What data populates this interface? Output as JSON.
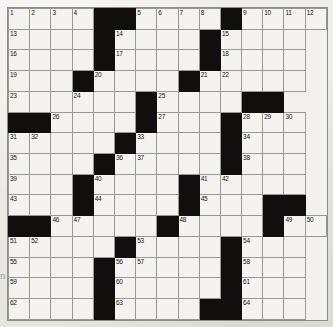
{
  "puzzle": {
    "type": "crossword-grid",
    "columns": 13,
    "rows": 15,
    "colors": {
      "block": "#100f0d",
      "cell": "#f4f3ef",
      "grid_line": "#9a9995",
      "page_background": "#ebeae6",
      "number_text": "#171614"
    },
    "margin_mark": "n",
    "grid": [
      [
        {
          "num": "1"
        },
        {
          "num": "2"
        },
        {
          "num": "3"
        },
        {
          "num": "4"
        },
        {
          "block": true
        },
        {
          "block": true
        },
        {
          "num": "5"
        },
        {
          "num": "6"
        },
        {
          "num": "7"
        },
        {
          "num": "8"
        },
        {
          "block": true
        },
        {
          "num": "9"
        },
        {
          "num": "10"
        },
        {
          "num": "11"
        },
        {
          "num": "12"
        }
      ],
      [
        {
          "num": "13"
        },
        {},
        {},
        {},
        {
          "block": true
        },
        {
          "num": "14"
        },
        {},
        {},
        {},
        {
          "block": true
        },
        {
          "num": "15"
        },
        {},
        {},
        {}
      ],
      [
        {
          "num": "16"
        },
        {},
        {},
        {},
        {
          "block": true
        },
        {
          "num": "17"
        },
        {},
        {},
        {},
        {
          "block": true
        },
        {
          "num": "18"
        },
        {},
        {},
        {}
      ],
      [
        {
          "num": "19"
        },
        {},
        {},
        {
          "block": true
        },
        {
          "num": "20"
        },
        {},
        {},
        {},
        {
          "block": true
        },
        {
          "num": "21"
        },
        {
          "num": "22"
        },
        {},
        {},
        {}
      ],
      [
        {
          "num": "23"
        },
        {},
        {},
        {
          "num": "24"
        },
        {},
        {},
        {
          "block": true
        },
        {
          "num": "25"
        },
        {},
        {},
        {},
        {
          "block": true
        },
        {
          "block": true
        }
      ],
      [
        {
          "block": true
        },
        {
          "block": true
        },
        {
          "num": "26"
        },
        {},
        {},
        {},
        {
          "block": true
        },
        {
          "num": "27"
        },
        {},
        {},
        {
          "block": true
        },
        {
          "num": "28"
        },
        {
          "num": "29"
        },
        {
          "num": "30"
        }
      ],
      [
        {
          "num": "31"
        },
        {
          "num": "32"
        },
        {},
        {},
        {},
        {
          "block": true
        },
        {
          "num": "33"
        },
        {},
        {},
        {},
        {
          "block": true
        },
        {
          "num": "34"
        },
        {},
        {}
      ],
      [
        {
          "num": "35"
        },
        {},
        {},
        {},
        {
          "block": true
        },
        {
          "num": "36"
        },
        {
          "num": "37"
        },
        {},
        {},
        {},
        {
          "block": true
        },
        {
          "num": "38"
        },
        {},
        {}
      ],
      [
        {
          "num": "39"
        },
        {},
        {},
        {
          "block": true
        },
        {
          "num": "40"
        },
        {},
        {},
        {},
        {
          "block": true
        },
        {
          "num": "41"
        },
        {
          "num": "42"
        },
        {},
        {},
        {}
      ],
      [
        {
          "num": "43"
        },
        {},
        {},
        {
          "block": true
        },
        {
          "num": "44"
        },
        {},
        {},
        {},
        {
          "block": true
        },
        {
          "num": "45"
        },
        {},
        {},
        {
          "block": true
        },
        {
          "block": true
        }
      ],
      [
        {
          "block": true
        },
        {
          "block": true
        },
        {
          "num": "46"
        },
        {
          "num": "47"
        },
        {},
        {},
        {},
        {
          "block": true
        },
        {
          "num": "48"
        },
        {},
        {},
        {},
        {
          "block": true
        },
        {
          "num": "49"
        },
        {
          "num": "50"
        }
      ],
      [
        {
          "num": "51"
        },
        {
          "num": "52"
        },
        {},
        {},
        {},
        {
          "block": true
        },
        {
          "num": "53"
        },
        {},
        {},
        {},
        {
          "block": true
        },
        {
          "num": "54"
        },
        {},
        {}
      ],
      [
        {
          "num": "55"
        },
        {},
        {},
        {},
        {
          "block": true
        },
        {
          "num": "56"
        },
        {
          "num": "57"
        },
        {},
        {},
        {},
        {
          "block": true
        },
        {
          "num": "58"
        },
        {},
        {}
      ],
      [
        {
          "num": "59"
        },
        {},
        {},
        {},
        {
          "block": true
        },
        {
          "num": "60"
        },
        {},
        {},
        {},
        {},
        {
          "block": true
        },
        {
          "num": "61"
        },
        {},
        {}
      ],
      [
        {
          "num": "62"
        },
        {},
        {},
        {},
        {
          "block": true
        },
        {
          "num": "63"
        },
        {},
        {},
        {},
        {
          "block": true
        },
        {
          "block": true
        },
        {
          "num": "64"
        },
        {},
        {}
      ]
    ]
  }
}
